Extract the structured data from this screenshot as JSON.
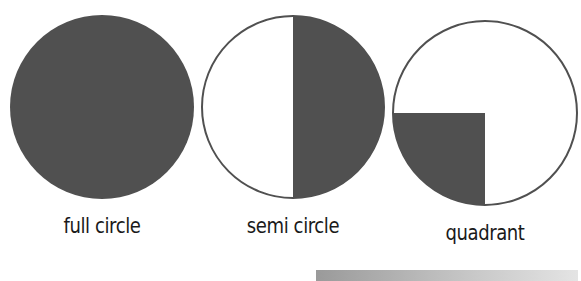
{
  "diagram": {
    "shapes": [
      {
        "name": "full circle",
        "label": "full circle",
        "fill": "full"
      },
      {
        "name": "semi circle",
        "label": "semi circle",
        "fill": "right half"
      },
      {
        "name": "quadrant",
        "label": "quadrant",
        "fill": "bottom-left quarter"
      }
    ],
    "colors": {
      "fill": "#505050",
      "outline": "#505050",
      "background": "#ffffff"
    }
  }
}
